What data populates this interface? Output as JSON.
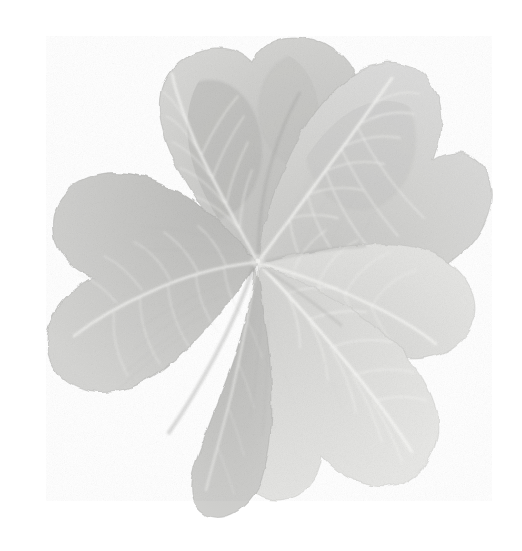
{
  "image": {
    "subject": "five-leaf clover",
    "alt_text": "A five-leaflet clover leaf photographed flat on a plain white background",
    "background_color": "#ffffff",
    "rendering": "desaturated grayscale scan with grainy paper-like texture",
    "width_px": 522,
    "height_px": 551,
    "center_point": {
      "x": 258,
      "y": 261
    }
  },
  "palette": {
    "background": "#ffffff",
    "leaf_light": "#e2e2e0",
    "leaf_mid": "#d0d0ce",
    "leaf_base": "#c6c6c4",
    "leaf_dark": "#b4b4b2",
    "leaf_shadow": "#a8a8a6",
    "vein_highlight": "#f0f0ee",
    "edge_tone": "#bcbcba"
  },
  "leaflets": [
    {
      "id": "leaflet-upper-left",
      "label": "Upper left leaflet",
      "angle_deg": -118,
      "tip": {
        "x": 128,
        "y": 66
      },
      "tone": "#c8c8c6",
      "relative_size": 0.98
    },
    {
      "id": "leaflet-top",
      "label": "Top leaflet",
      "angle_deg": -62,
      "tip": {
        "x": 337,
        "y": 28
      },
      "tone": "#d4d4d2",
      "relative_size": 1.0
    },
    {
      "id": "leaflet-right",
      "label": "Right leaflet",
      "angle_deg": -10,
      "tip": {
        "x": 470,
        "y": 150
      },
      "tone": "#dadad8",
      "relative_size": 0.88
    },
    {
      "id": "leaflet-lower-right",
      "label": "Lower right leaflet",
      "angle_deg": 46,
      "tip": {
        "x": 440,
        "y": 400
      },
      "tone": "#dedede",
      "relative_size": 1.02
    },
    {
      "id": "leaflet-lower-left",
      "label": "Lower left leaflet",
      "angle_deg": 122,
      "tip": {
        "x": 102,
        "y": 404
      },
      "tone": "#c6c6c4",
      "relative_size": 1.0
    },
    {
      "id": "leaflet-bottom",
      "label": "Bottom leaflet",
      "angle_deg": 88,
      "tip": {
        "x": 250,
        "y": 470
      },
      "tone": "#c2c2c0",
      "relative_size": 0.82
    }
  ],
  "features": {
    "leaflet_count": 5,
    "vein_pattern": "pinnate with central midrib and paired lateral veins",
    "apex_shape": "notched / emarginate",
    "margin": "entire, slightly undulating",
    "texture": "fine grain speckle"
  }
}
